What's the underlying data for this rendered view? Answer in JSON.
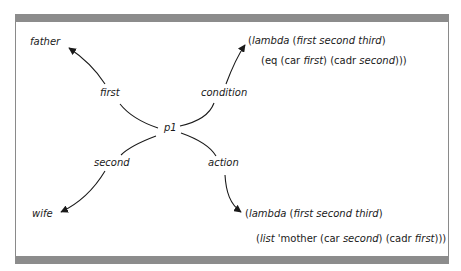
{
  "diagram": {
    "center_node": "p1",
    "edges": [
      {
        "label": "first",
        "target": "father"
      },
      {
        "label": "second",
        "target": "wife"
      },
      {
        "label": "condition",
        "target": "condition-lambda"
      },
      {
        "label": "action",
        "target": "action-lambda"
      }
    ],
    "nodes": {
      "father": "father",
      "wife": "wife",
      "p1": "p1"
    },
    "labels": {
      "first": "first",
      "second": "second",
      "condition": "condition",
      "action": "action"
    },
    "condition_lambda": {
      "line1": {
        "open": "(",
        "kw": "lambda",
        "args_open": " (",
        "args": "first second third",
        "args_close": ")"
      },
      "line2": {
        "p1": "(eq (car ",
        "a": "first",
        "p2": ") (cadr ",
        "b": "second",
        "p3": ")))"
      }
    },
    "action_lambda": {
      "line1": {
        "open": "(",
        "kw": "lambda",
        "args_open": " (",
        "args": "first second third",
        "args_close": ")"
      },
      "line2": {
        "open": "(",
        "kw": "list",
        "p1": " 'mother (car ",
        "a": "second",
        "p2": ") (cadr ",
        "b": "first",
        "p3": ")))"
      }
    },
    "colors": {
      "ink": "#1a1a1a",
      "frame_bar": "#8c8c8c",
      "frame_line": "#8a8a8a",
      "background": "#ffffff"
    }
  }
}
